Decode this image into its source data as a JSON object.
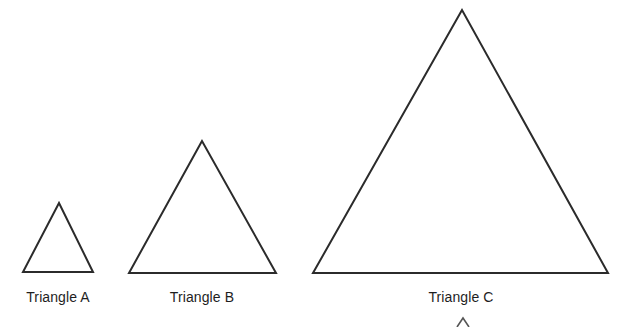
{
  "figure": {
    "background_color": "#ffffff",
    "stroke_color": "#2b2b2b",
    "stroke_width": 2,
    "width": 627,
    "height": 327
  },
  "chart_data": {
    "type": "diagram",
    "xlabel": "",
    "ylabel": "",
    "grid": false,
    "legend": "none",
    "shapes": [
      {
        "name": "Triangle A",
        "label": "Triangle A",
        "apex": [
          59,
          203
        ],
        "base_left": [
          23,
          272
        ],
        "base_right": [
          93,
          272
        ],
        "base_width": 70,
        "height": 69,
        "label_center_x": 58,
        "label_top_y": 289
      },
      {
        "name": "Triangle B",
        "label": "Triangle B",
        "apex": [
          202,
          141
        ],
        "base_left": [
          129,
          273
        ],
        "base_right": [
          276,
          273
        ],
        "base_width": 147,
        "height": 132,
        "label_center_x": 202,
        "label_top_y": 289
      },
      {
        "name": "Triangle C",
        "label": "Triangle C",
        "apex": [
          462,
          10
        ],
        "base_left": [
          313,
          273
        ],
        "base_right": [
          608,
          273
        ],
        "base_width": 295,
        "height": 263,
        "label_center_x": 461,
        "label_top_y": 289
      }
    ],
    "partial_shape": {
      "name": "Triangle D (cut off)",
      "apex": [
        463,
        318
      ],
      "visible_left": [
        457,
        327
      ],
      "visible_right": [
        469,
        327
      ]
    }
  },
  "triangles": [
    {
      "label": "Triangle A"
    },
    {
      "label": "Triangle B"
    },
    {
      "label": "Triangle C"
    }
  ]
}
